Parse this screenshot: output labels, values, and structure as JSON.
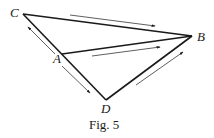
{
  "figure": {
    "caption": "Fig. 5",
    "points": {
      "A": {
        "label": "A"
      },
      "B": {
        "label": "B"
      },
      "C": {
        "label": "C"
      },
      "D": {
        "label": "D"
      }
    },
    "edges": [
      "C-B",
      "C-D",
      "A-B",
      "D-B"
    ],
    "arrows": [
      {
        "along": "C-B",
        "direction": "toward B"
      },
      {
        "along": "A-B",
        "direction": "toward B"
      },
      {
        "along": "A-C",
        "direction": "toward C"
      },
      {
        "along": "A-D",
        "direction": "toward D"
      },
      {
        "along": "D-B",
        "direction": "toward B"
      }
    ]
  }
}
